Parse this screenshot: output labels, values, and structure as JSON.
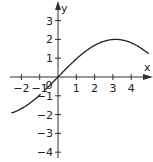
{
  "chart_data": {
    "type": "line",
    "title": "",
    "xlabel": "x",
    "ylabel": "y",
    "xlim": [
      -2.6,
      5
    ],
    "ylim": [
      -4.3,
      3.6
    ],
    "x_ticks": [
      -2,
      -1,
      0,
      1,
      2,
      3,
      4
    ],
    "y_ticks": [
      -4,
      -3,
      -2,
      -1,
      1,
      2,
      3
    ],
    "x_tick_labels": [
      "-2",
      "-1",
      "0",
      "1",
      "2",
      "3",
      "4"
    ],
    "y_tick_labels": [
      "-4",
      "-3",
      "-2",
      "-1",
      "1",
      "2",
      "3"
    ],
    "grid": false,
    "legend": null,
    "function": "y = 2 sin(x/2)",
    "series": [
      {
        "name": "f(x)",
        "x": [
          -2.5,
          -2,
          -1.5,
          -1,
          -0.5,
          0,
          0.5,
          1,
          1.5,
          2,
          2.5,
          3,
          3.14,
          3.5,
          4,
          4.5,
          4.9
        ],
        "values": [
          -1.9,
          -1.68,
          -1.36,
          -0.96,
          -0.5,
          0,
          0.5,
          0.96,
          1.36,
          1.68,
          1.9,
          2.0,
          2.0,
          1.97,
          1.82,
          1.56,
          1.27
        ]
      }
    ]
  },
  "axes": {
    "x_label": "x",
    "y_label": "y",
    "origin_label": "0"
  }
}
